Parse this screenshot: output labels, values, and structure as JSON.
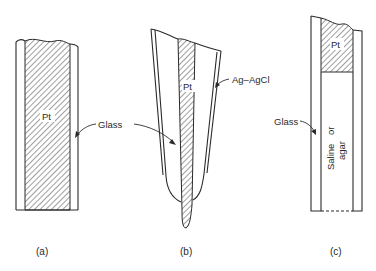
{
  "figure": {
    "panels": [
      {
        "id": "a",
        "caption": "(a)",
        "labels": {
          "metal": "Pt",
          "insulator": "Glass"
        },
        "description": "Pt wire sealed in glass, flat exposed tip"
      },
      {
        "id": "b",
        "caption": "(b)",
        "labels": {
          "metal": "Pt",
          "insulator": "Glass",
          "coating": "Ag–AgCl"
        },
        "description": "Tapered Pt microelectrode in glass with Ag-AgCl outer coating"
      },
      {
        "id": "c",
        "caption": "(c)",
        "labels": {
          "metal": "Pt",
          "insulator": "Glass",
          "fill_line1": "Saline",
          "fill_line2": "or",
          "fill_line3": "agar",
          "fill": "Saline or agar"
        },
        "description": "Glass pipette with Pt contact over saline or agar fill, open tip"
      }
    ],
    "colors": {
      "ink": "#2a2a2a",
      "background": "#ffffff"
    }
  }
}
